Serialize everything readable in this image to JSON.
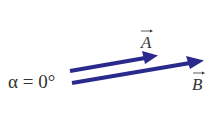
{
  "diagram": {
    "angle_label": "α = 0°",
    "vector_a": {
      "label": "A",
      "color": "#2a2a8c"
    },
    "vector_b": {
      "label": "B",
      "color": "#2a2a8c"
    }
  }
}
